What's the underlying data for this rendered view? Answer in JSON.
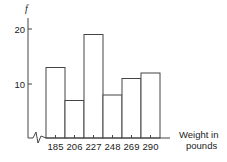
{
  "chart_data": {
    "type": "bar",
    "subtype": "histogram",
    "title": "",
    "categories": [
      "185",
      "206",
      "227",
      "248",
      "269",
      "290"
    ],
    "values": [
      13,
      7,
      19,
      8,
      11,
      12
    ],
    "xlabel": "Weight in pounds",
    "xlabel_lines": [
      "Weight in",
      "pounds"
    ],
    "ylabel": "f",
    "yticks": [
      "10",
      "20"
    ],
    "ylim": [
      0,
      21
    ],
    "axis_break": true,
    "grid": false,
    "legend": null
  },
  "colors": {
    "line": "#333333",
    "background": "#ffffff"
  }
}
